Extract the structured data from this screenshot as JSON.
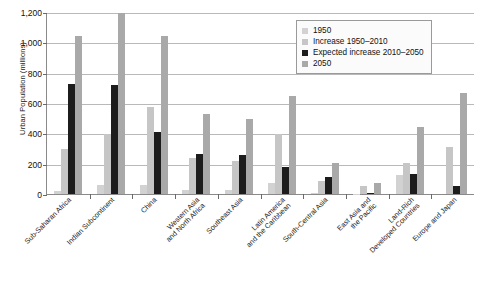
{
  "chart_data": {
    "type": "bar",
    "title": "",
    "xlabel": "",
    "ylabel": "Urban Population (millions)",
    "ylim": [
      0,
      1200
    ],
    "yticks": [
      0,
      200,
      400,
      600,
      800,
      1000,
      1200
    ],
    "ytick_labels": [
      "0",
      "200",
      "400",
      "600",
      "800",
      "1,000",
      "1,200"
    ],
    "grid": true,
    "legend_position": "top-right",
    "categories": [
      "Sub-Saharan Africa",
      "Indian Subcontinent",
      "China",
      "Western Asia\nand North Africa",
      "Southeast Asia",
      "Latin America\nand the Caribbean",
      "South-Central Asia",
      "East Asia and\nthe Pacific",
      "Land-Rich\nDeveloped Countries",
      "Europe and Japan"
    ],
    "series": [
      {
        "name": "1950",
        "color": "#d2d2d2",
        "values": [
          20,
          60,
          60,
          25,
          25,
          70,
          10,
          2,
          125,
          0
        ]
      },
      {
        "name": "Increase 1950–2010",
        "color": "#c6c6c6",
        "values": [
          300,
          400,
          580,
          240,
          220,
          400,
          85,
          55,
          205,
          315
        ]
      },
      {
        "name": "Expected increase 2010–2050",
        "color": "#1c1c1c",
        "values": [
          730,
          720,
          410,
          265,
          260,
          180,
          110,
          5,
          130,
          50
        ]
      },
      {
        "name": "2050",
        "color": "#a9a9a9",
        "values": [
          1050,
          1200,
          1050,
          530,
          500,
          650,
          205,
          70,
          445,
          670
        ]
      }
    ]
  }
}
